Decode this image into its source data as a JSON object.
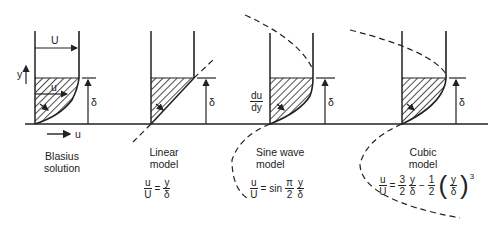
{
  "figure": {
    "axis_labels": {
      "y": "y",
      "u_arrow": "u"
    },
    "panels": [
      {
        "name": "blasius",
        "label_line1": "Blasius",
        "label_line2": "solution",
        "U_label": "U",
        "u_label": "u",
        "delta_label": "δ",
        "equation": null
      },
      {
        "name": "linear",
        "label_line1": "Linear",
        "label_line2": "model",
        "delta_label": "δ",
        "equation": {
          "lhs_num": "u",
          "lhs_den": "U",
          "eq": "=",
          "rhs_num": "y",
          "rhs_den": "δ"
        }
      },
      {
        "name": "sine",
        "label_line1": "Sine wave",
        "label_line2": "model",
        "delta_label": "δ",
        "slope_num": "du",
        "slope_den": "dy",
        "equation": {
          "lhs_num": "u",
          "lhs_den": "U",
          "eq": "= sin",
          "c_num": "π",
          "c_den": "2",
          "rhs_num": "y",
          "rhs_den": "δ"
        }
      },
      {
        "name": "cubic",
        "label_line1": "Cubic",
        "label_line2": "model",
        "delta_label": "δ",
        "equation": {
          "lhs_num": "u",
          "lhs_den": "U",
          "eq": "=",
          "a_num": "3",
          "a_den": "2",
          "y1_num": "y",
          "y1_den": "δ",
          "minus": "−",
          "b_num": "1",
          "b_den": "2",
          "y2_num": "y",
          "y2_den": "δ",
          "exp": "3"
        }
      }
    ]
  }
}
